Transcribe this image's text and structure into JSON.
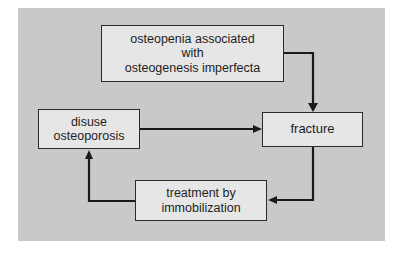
{
  "diagram": {
    "type": "flowchart",
    "nodes": {
      "top": {
        "lines": [
          "osteopenia associated",
          "with",
          "osteogenesis imperfecta"
        ]
      },
      "fracture": {
        "lines": [
          "fracture"
        ]
      },
      "disuse": {
        "lines": [
          "disuse",
          "osteoporosis"
        ]
      },
      "treatment": {
        "lines": [
          "treatment by",
          "immobilization"
        ]
      }
    },
    "edges": [
      {
        "from": "osteopenia associated with osteogenesis imperfecta",
        "to": "fracture"
      },
      {
        "from": "disuse osteoporosis",
        "to": "fracture"
      },
      {
        "from": "fracture",
        "to": "treatment by immobilization"
      },
      {
        "from": "treatment by immobilization",
        "to": "disuse osteoporosis"
      }
    ],
    "colors": {
      "background": "#c9c9c9",
      "box_fill": "#e6e6e6",
      "stroke": "#1a1a1a"
    }
  }
}
